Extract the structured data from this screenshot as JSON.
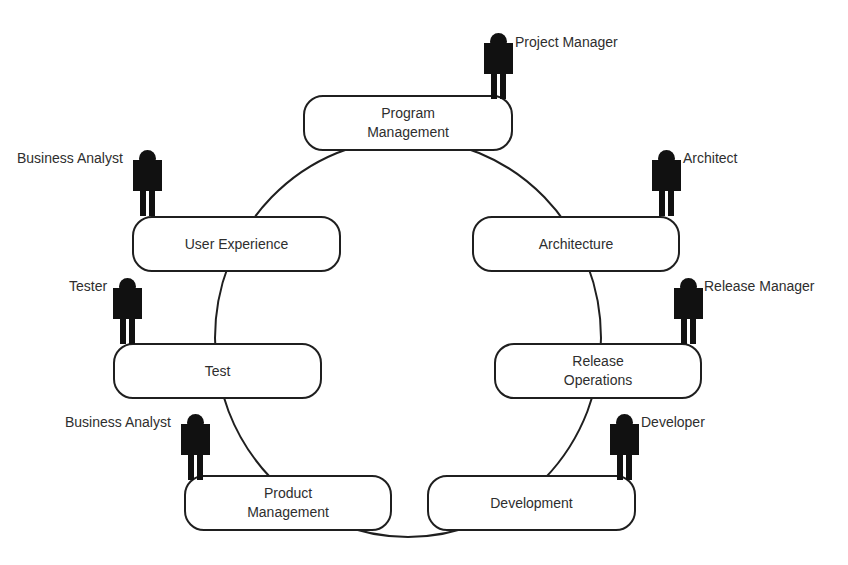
{
  "diagram": {
    "type": "cycle",
    "ring_color": "#1f1f1f",
    "box_border_color": "#1f1f1f",
    "figure_color": "#111111",
    "stages": [
      {
        "id": "program-management",
        "line1": "Program",
        "line2": "Management",
        "role": "Project Manager"
      },
      {
        "id": "architecture",
        "line1": "Architecture",
        "line2": "",
        "role": "Architect"
      },
      {
        "id": "release-operations",
        "line1": "Release",
        "line2": "Operations",
        "role": "Release Manager"
      },
      {
        "id": "development",
        "line1": "Development",
        "line2": "",
        "role": "Developer"
      },
      {
        "id": "product-management",
        "line1": "Product",
        "line2": "Management",
        "role": "Business Analyst"
      },
      {
        "id": "test",
        "line1": "Test",
        "line2": "",
        "role": "Tester"
      },
      {
        "id": "user-experience",
        "line1": "User Experience",
        "line2": "",
        "role": "Business Analyst"
      }
    ],
    "icons": {
      "role_figure": "person-icon"
    }
  }
}
